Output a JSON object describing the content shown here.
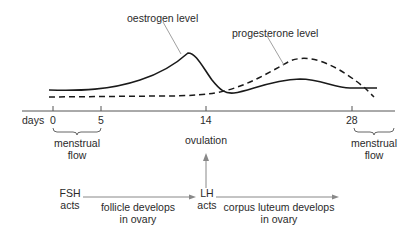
{
  "curves": {
    "oestrogen_label": "oestrogen level",
    "progesterone_label": "progesterone level"
  },
  "axis": {
    "label": "days",
    "ticks": [
      "0",
      "5",
      "14",
      "28"
    ]
  },
  "annotations": {
    "menstrual_flow_start_line1": "menstrual",
    "menstrual_flow_start_line2": "flow",
    "ovulation": "ovulation",
    "menstrual_flow_end_line1": "menstrual",
    "menstrual_flow_end_line2": "flow"
  },
  "hormones": {
    "fsh_line1": "FSH",
    "fsh_line2": "acts",
    "follicle_line1": "follicle develops",
    "follicle_line2": "in ovary",
    "lh_line1": "LH",
    "lh_line2": "acts",
    "corpus_line1": "corpus luteum develops",
    "corpus_line2": "in ovary"
  },
  "colors": {
    "line": "#1a1a1a",
    "leader": "#888888",
    "axis": "#555555"
  }
}
